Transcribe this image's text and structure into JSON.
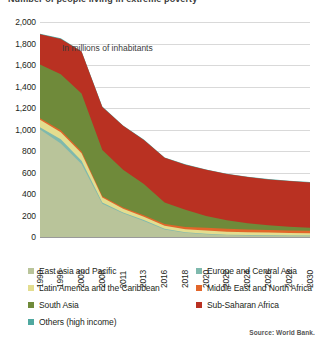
{
  "title": "Number of people living in extreme poverty",
  "subtitle": "In millions of inhabitants",
  "source": "Source: World Bank.",
  "axes": {
    "y_ticks": [
      "2,000",
      "1,800",
      "1,600",
      "1,400",
      "1,200",
      "1,000",
      "800",
      "600",
      "400",
      "200",
      "0"
    ],
    "x_ticks": [
      "1990",
      "1996",
      "2002",
      "2008",
      "2011",
      "2013",
      "2016",
      "2018",
      "2020",
      "2022",
      "2024",
      "2026",
      "2028",
      "2030"
    ]
  },
  "legend": {
    "items": [
      {
        "label": "East Asia and Pacific",
        "color": "#b9c49a"
      },
      {
        "label": "Europe and Central Asia",
        "color": "#7fb9ad"
      },
      {
        "label": "Latin America and the Caribbean",
        "color": "#e3dd8f"
      },
      {
        "label": "Middle East and North Africa",
        "color": "#e2662a"
      },
      {
        "label": "South Asia",
        "color": "#6f8a3a"
      },
      {
        "label": "Sub-Saharan Africa",
        "color": "#b93122"
      },
      {
        "label": "Others (high income)",
        "color": "#4fa8a0"
      }
    ]
  },
  "chart_data": {
    "type": "area",
    "title": "Number of people living in extreme poverty",
    "subtitle": "In millions of inhabitants",
    "xlabel": "",
    "ylabel": "In millions of inhabitants",
    "ylim": [
      0,
      2000
    ],
    "ytick_step": 200,
    "grid": true,
    "stacked": true,
    "legend_position": "bottom",
    "source": "Source: World Bank.",
    "x": [
      "1990",
      "1996",
      "2002",
      "2008",
      "2011",
      "2013",
      "2016",
      "2018",
      "2020",
      "2022",
      "2024",
      "2026",
      "2028",
      "2030"
    ],
    "series": [
      {
        "name": "East Asia and Pacific",
        "color": "#b9c49a",
        "values": [
          1000,
          870,
          680,
          310,
          220,
          150,
          70,
          40,
          25,
          18,
          14,
          12,
          10,
          9
        ]
      },
      {
        "name": "Europe and Central Asia",
        "color": "#7fb9ad",
        "values": [
          20,
          40,
          30,
          12,
          8,
          7,
          6,
          5,
          5,
          4,
          4,
          4,
          4,
          4
        ]
      },
      {
        "name": "Latin America and the Caribbean",
        "color": "#e3dd8f",
        "values": [
          70,
          65,
          70,
          45,
          35,
          32,
          28,
          26,
          30,
          28,
          26,
          25,
          24,
          23
        ]
      },
      {
        "name": "Middle East and North Africa",
        "color": "#e2662a",
        "values": [
          15,
          18,
          15,
          12,
          12,
          14,
          18,
          22,
          26,
          26,
          25,
          24,
          23,
          22
        ]
      },
      {
        "name": "South Asia",
        "color": "#6f8a3a",
        "values": [
          500,
          520,
          540,
          430,
          350,
          290,
          200,
          160,
          110,
          80,
          60,
          45,
          35,
          28
        ]
      },
      {
        "name": "Sub-Saharan Africa",
        "color": "#b93122",
        "values": [
          280,
          330,
          390,
          400,
          410,
          410,
          415,
          420,
          430,
          430,
          428,
          426,
          424,
          422
        ]
      },
      {
        "name": "Others (high income)",
        "color": "#4fa8a0",
        "values": [
          5,
          5,
          4,
          4,
          3,
          3,
          3,
          3,
          3,
          3,
          3,
          3,
          3,
          3
        ]
      }
    ],
    "totals": [
      1890,
      1848,
      1729,
      1213,
      1038,
      906,
      740,
      676,
      629,
      589,
      560,
      539,
      523,
      511
    ]
  }
}
